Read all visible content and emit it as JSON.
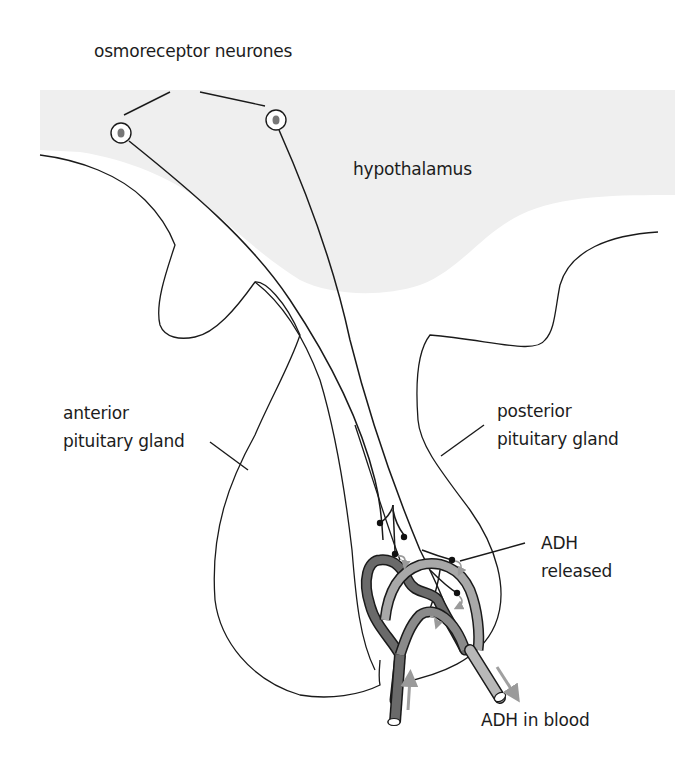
{
  "figure": {
    "labels": {
      "osmoreceptors": "osmoreceptor neurones",
      "hypothalamus": "hypothalamus",
      "anterior_line1": "anterior",
      "anterior_line2": "pituitary gland",
      "posterior_line1": "posterior",
      "posterior_line2": "pituitary gland",
      "adh_released_line1": "ADH",
      "adh_released_line2": "released",
      "adh_in_blood": "ADH in blood"
    },
    "colors": {
      "hypothalamus_fill": "#efefef",
      "outline": "#1a1a1a",
      "artery_dark": "#6a6a6a",
      "vein_light": "#b8b8b8",
      "flow_arrow": "#a0a0a0",
      "cell_nucleus": "#777777"
    },
    "elements": {
      "neurone_count": 2,
      "nerve_terminals": 6,
      "release_arrows": 5,
      "blood_flow_arrows": 2
    }
  }
}
